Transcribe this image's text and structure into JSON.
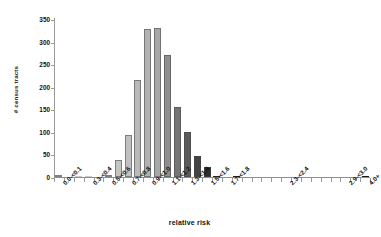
{
  "chart_data": {
    "type": "bar",
    "title": "",
    "subtitle": "",
    "xlabel": "relative risk",
    "ylabel": "# census tracts",
    "ylim": [
      0,
      350
    ],
    "yticks": [
      0,
      50,
      100,
      150,
      200,
      250,
      300,
      350
    ],
    "ytick_labels": [
      "0",
      "50",
      "100",
      "150",
      "200",
      "250",
      "300",
      "350"
    ],
    "grid": false,
    "legend": null,
    "legend_position": "none",
    "bar_gap_ratio": 0.28,
    "categories": [
      "0.0-<0.1",
      "0.1-<0.2",
      "0.2-<0.3",
      "0.3-<0.4",
      "0.4-<0.5",
      "0.5-<0.6",
      "0.6-<0.7",
      "0.7-<0.8",
      "0.8-<0.9",
      "0.9-<1.0",
      "1.0-<1.1",
      "1.1-<1.2",
      "1.2-<1.3",
      "1.3-<1.4",
      "1.4-<1.5",
      "1.5-<1.6",
      "1.6-<1.7",
      "1.7-<1.8",
      "1.8-<1.9",
      "1.9-<2.0",
      "2.0-<2.1",
      "2.1-<2.2",
      "2.2-<2.3",
      "2.3-<2.4",
      "2.4-<2.5",
      "2.5-<2.6",
      "2.6-<2.7",
      "2.7-<2.8",
      "2.8-<2.9",
      "2.9-<3.0",
      "3.0+",
      "4.0+"
    ],
    "values": [
      5,
      0,
      1,
      2,
      0,
      5,
      38,
      92,
      215,
      328,
      331,
      271,
      155,
      99,
      47,
      23,
      2,
      0,
      2,
      0,
      0,
      0,
      0,
      0,
      0,
      0,
      0,
      0,
      0,
      0,
      0,
      2
    ],
    "bar_colors": [
      "#c9c9c9",
      "#c9c9c9",
      "#c9c9c9",
      "#c9c9c9",
      "#c9c9c9",
      "#c6c6c6",
      "#c4c4c4",
      "#c0c0c0",
      "#b9b9b9",
      "#b2b2b2",
      "#a8a8a8",
      "#8f8f8f",
      "#757575",
      "#5a5a5a",
      "#434343",
      "#2e2e2e",
      "#242424",
      "#222222",
      "#202020",
      "#1e1e1e",
      "#1c1c1c",
      "#1c1c1c",
      "#1b1b1b",
      "#1a1a1a",
      "#1a1a1a",
      "#191919",
      "#191919",
      "#181818",
      "#181818",
      "#181818",
      "#171717",
      "#171717"
    ],
    "xtick_label_indices": [
      0,
      3,
      5,
      7,
      9,
      11,
      13,
      15,
      17,
      23,
      29,
      31
    ],
    "xtick_labels_shown": [
      "0.0-<0.1",
      "0.3-<0.4",
      "0.5-<0.6",
      "0.7-<0.8",
      "0.9-<1.0",
      "1.1-<1.2",
      "1.3-<1.4",
      "1.5-<1.6",
      "1.7-<1.8",
      "2.3-<2.4",
      "2.9-<3.0",
      "4.0+"
    ]
  }
}
